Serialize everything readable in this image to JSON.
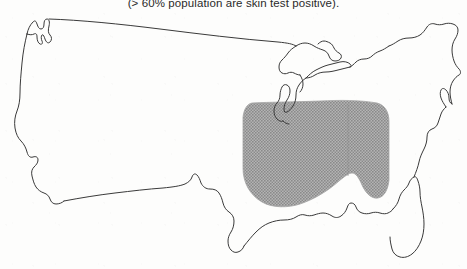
{
  "figure": {
    "caption": "(> 60% population are skin test positive).",
    "caption_truncated_top": true,
    "background_color": "#fdfdfc",
    "outline_color": "#3a3a3a",
    "outline_width_px": 1,
    "shaded_region": {
      "label": "endemic-region-overlay",
      "fill_color": "#9d9d9d",
      "pattern": "halftone-dither-50-percent",
      "description": "Ohio and Mississippi River valley region",
      "bounds_px": {
        "x": 243,
        "y": 101,
        "width": 147,
        "height": 107
      },
      "divider_line_color": "#8a8a8a"
    },
    "map": {
      "name": "united-states-outline",
      "bounds_px": {
        "x": 10,
        "y": 14,
        "width": 450,
        "height": 250
      },
      "features": [
        "west-coast",
        "canadian-border",
        "great-lakes",
        "new-england-coast",
        "atlantic-coast",
        "florida-peninsula",
        "gulf-coast",
        "mexican-border"
      ]
    }
  }
}
